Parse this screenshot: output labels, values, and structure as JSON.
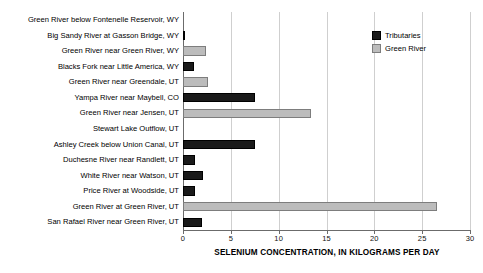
{
  "chart_data": {
    "type": "bar",
    "orientation": "horizontal",
    "title": "",
    "xlabel": "SELENIUM CONCENTRATION, IN KILOGRAMS PER DAY",
    "ylabel": "",
    "xlim": [
      0,
      30
    ],
    "xticks": [
      0,
      5,
      10,
      15,
      20,
      25,
      30
    ],
    "grid": true,
    "legend_position": "top-right",
    "legend": [
      {
        "name": "Tributaries",
        "color": "#1a1a1a"
      },
      {
        "name": "Green River",
        "color": "#bcbcbc"
      }
    ],
    "categories": [
      "Green River below Fontenelle Reservoir, WY",
      "Big Sandy River at Gasson Bridge, WY",
      "Green River near Green River, WY",
      "Blacks Fork near Little America, WY",
      "Green River near Greendale, UT",
      "Yampa River near Maybell, CO",
      "Green River near Jensen, UT",
      "Stewart Lake Outflow, UT",
      "Ashley Creek below Union Canal, UT",
      "Duchesne River near Randlett, UT",
      "White River near Watson, UT",
      "Price River at Woodside, UT",
      "Green River at Green River, UT",
      "San Rafael River near Green River, UT"
    ],
    "values": [
      0.0,
      0.2,
      2.4,
      1.1,
      2.6,
      7.5,
      13.4,
      0.0,
      7.5,
      1.3,
      2.1,
      1.3,
      26.6,
      2.0
    ],
    "series_of": [
      "Green River",
      "Tributaries",
      "Green River",
      "Tributaries",
      "Green River",
      "Tributaries",
      "Green River",
      "Tributaries",
      "Tributaries",
      "Tributaries",
      "Tributaries",
      "Tributaries",
      "Green River",
      "Tributaries"
    ]
  }
}
